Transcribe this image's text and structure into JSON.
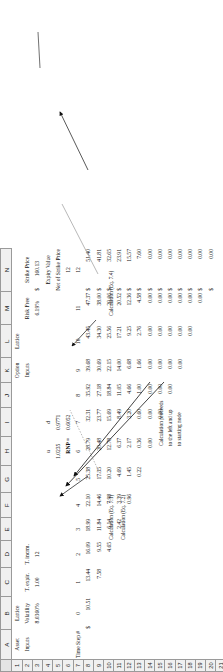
{
  "app": {
    "type": "spreadsheet",
    "title": "Binomial Lattice Option Valuation Worksheet"
  },
  "column_headers": [
    "",
    "A",
    "B",
    "C",
    "D",
    "E",
    "F",
    "G",
    "H",
    "I",
    "J",
    "K",
    "L",
    "M",
    "N"
  ],
  "row_headers": [
    "1",
    "2",
    "3",
    "4",
    "5",
    "6",
    "7",
    "8",
    "9",
    "10",
    "11",
    "12",
    "13",
    "14",
    "15",
    "16",
    "17",
    "18",
    "19",
    "20",
    "21"
  ],
  "labels": {
    "asset_lattice_inputs_l1": "Asset",
    "asset_lattice_inputs_l2": "Lattice",
    "asset_lattice_inputs_l3": "Inputs",
    "option_lattice_inputs_l1": "Option",
    "option_lattice_inputs_l2": "Lattice",
    "option_lattice_inputs_l3": "Inputs",
    "volatility": "Volatility",
    "t_expir": "T. expir.",
    "t_incrm": "T. incrm.",
    "risk_free": "Risk Free",
    "strike_price": "Strike Price",
    "u": "u",
    "d": "d",
    "rnp": "RNP =",
    "time_step": "Time Step #",
    "expiry_value_l1": "Expiry Value",
    "expiry_value_l2": "Net of Strike Price",
    "calc_eq_71": "Calculation (Eq. 7.1)",
    "calc_eq_72": "Calculation (Eq. 7.2)",
    "calc_eq_74": "Calculation (Eq. 7.4)",
    "calc_proceeds_l1": "Calculation proceeds",
    "calc_proceeds_l2": "to the left and up",
    "calc_proceeds_l3": "to starting node",
    "dollar": "$"
  },
  "inputs": {
    "volatility": "8.0360%",
    "t_expir": "1.00",
    "t_incrm": "12",
    "risk_free": "6.19%",
    "strike_price": "160.13",
    "u": "1.0235",
    "d": "0.9771",
    "rnp": "0.6052"
  },
  "time_steps": [
    "0",
    "1",
    "2",
    "3",
    "4",
    "5",
    "6",
    "7",
    "8",
    "9",
    "10",
    "11",
    "12"
  ],
  "lattice": {
    "start_value": "10.51",
    "rows": [
      [
        "10.51",
        "13.44",
        "16.09",
        "18.99",
        "22.10",
        "25.38",
        "28.79",
        "32.31",
        "35.92",
        "39.68",
        "43.45",
        "47.37",
        "51.40"
      ],
      [
        "",
        "7.58",
        "9.55",
        "11.84",
        "14.46",
        "17.35",
        "20.48",
        "23.77",
        "27.18",
        "30.69",
        "34.30",
        "38.00",
        "41.81"
      ],
      [
        "",
        "",
        "4.65",
        "6.14",
        "7.98",
        "10.20",
        "12.78",
        "15.69",
        "18.84",
        "22.15",
        "25.56",
        "29.06",
        "32.65"
      ],
      [
        "",
        "",
        "",
        "2.42",
        "3.39",
        "4.69",
        "6.37",
        "8.49",
        "11.05",
        "14.00",
        "17.21",
        "20.52",
        "23.91"
      ],
      [
        "",
        "",
        "",
        "",
        "0.96",
        "1.45",
        "2.17",
        "3.20",
        "4.66",
        "6.68",
        "9.25",
        "12.36",
        "15.57"
      ],
      [
        "",
        "",
        "",
        "",
        "",
        "0.22",
        "0.36",
        "0.60",
        "1.00",
        "1.66",
        "2.76",
        "4.58",
        "7.60"
      ],
      [
        "",
        "",
        "",
        "",
        "",
        "",
        "0.00",
        "0.00",
        "0.00",
        "0.00",
        "0.00",
        "0.00",
        "0.00"
      ],
      [
        "",
        "",
        "",
        "",
        "",
        "",
        "",
        "0.00",
        "0.00",
        "0.00",
        "0.00",
        "0.00",
        "0.00"
      ],
      [
        "",
        "",
        "",
        "",
        "",
        "",
        "",
        "",
        "0.00",
        "0.00",
        "0.00",
        "0.00",
        "0.00"
      ],
      [
        "",
        "",
        "",
        "",
        "",
        "",
        "",
        "",
        "",
        "0.00",
        "0.00",
        "0.00",
        "0.00"
      ],
      [
        "",
        "",
        "",
        "",
        "",
        "",
        "",
        "",
        "",
        "",
        "0.00",
        "0.00",
        "0.00"
      ],
      [
        "",
        "",
        "",
        "",
        "",
        "",
        "",
        "",
        "",
        "",
        "",
        "0.00",
        "0.00"
      ],
      [
        "",
        "",
        "",
        "",
        "",
        "",
        "",
        "",
        "",
        "",
        "",
        "",
        "0.00"
      ]
    ]
  },
  "expiry_column": {
    "header_l1": "Expiry Value",
    "header_l2": "Net of Strike Price",
    "step": "12",
    "values": [
      "51.40",
      "41.81",
      "32.65",
      "23.91",
      "15.57",
      "7.60",
      "0.00",
      "0.00",
      "0.00",
      "0.00",
      "0.00",
      "0.00",
      "0.00"
    ]
  },
  "colors": {
    "grid_line": "#9a9a9a",
    "header_fill": "#f0f0f0",
    "text": "#111111",
    "box_border": "#3a3a3a"
  }
}
